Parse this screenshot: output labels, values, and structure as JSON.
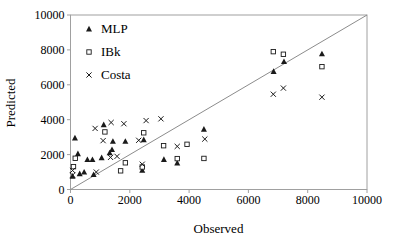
{
  "chart_data": {
    "type": "scatter",
    "title": "",
    "xlabel": "Observed",
    "ylabel": "Predicted",
    "xlim": [
      0,
      10000
    ],
    "ylim": [
      0,
      10000
    ],
    "x_ticks": [
      0,
      2000,
      4000,
      6000,
      8000,
      10000
    ],
    "y_ticks": [
      0,
      2000,
      4000,
      6000,
      8000,
      10000
    ],
    "grid": false,
    "legend_position": "top-left-inside",
    "reference_line": {
      "from": [
        0,
        0
      ],
      "to": [
        10000,
        10000
      ]
    },
    "series": [
      {
        "name": "MLP",
        "marker": "filled-triangle",
        "points": [
          [
            70,
            760
          ],
          [
            150,
            2950
          ],
          [
            250,
            2050
          ],
          [
            310,
            900
          ],
          [
            460,
            990
          ],
          [
            570,
            1710
          ],
          [
            740,
            1710
          ],
          [
            780,
            850
          ],
          [
            1050,
            1820
          ],
          [
            1120,
            3710
          ],
          [
            1320,
            2100
          ],
          [
            1400,
            2280
          ],
          [
            1430,
            2760
          ],
          [
            1850,
            2760
          ],
          [
            2420,
            1100
          ],
          [
            2470,
            2850
          ],
          [
            3150,
            1720
          ],
          [
            3600,
            1520
          ],
          [
            4500,
            3450
          ],
          [
            6850,
            6760
          ],
          [
            7200,
            7330
          ],
          [
            8480,
            7770
          ]
        ]
      },
      {
        "name": "IBk",
        "marker": "open-square",
        "points": [
          [
            100,
            1310
          ],
          [
            160,
            1790
          ],
          [
            1160,
            3300
          ],
          [
            1690,
            1070
          ],
          [
            1850,
            1530
          ],
          [
            2420,
            1290
          ],
          [
            2470,
            3250
          ],
          [
            3140,
            2510
          ],
          [
            3600,
            1770
          ],
          [
            3930,
            2590
          ],
          [
            4500,
            1780
          ],
          [
            6840,
            7900
          ],
          [
            7180,
            7750
          ],
          [
            8480,
            7040
          ]
        ]
      },
      {
        "name": "Costa",
        "marker": "x-cross",
        "points": [
          [
            70,
            820
          ],
          [
            70,
            1090
          ],
          [
            830,
            3500
          ],
          [
            870,
            1000
          ],
          [
            1100,
            2800
          ],
          [
            1350,
            1840
          ],
          [
            1370,
            3840
          ],
          [
            1570,
            1900
          ],
          [
            1800,
            3770
          ],
          [
            2300,
            2820
          ],
          [
            2420,
            1450
          ],
          [
            2550,
            3950
          ],
          [
            3050,
            4050
          ],
          [
            3600,
            2470
          ],
          [
            4530,
            2890
          ],
          [
            6840,
            5460
          ],
          [
            7180,
            5810
          ],
          [
            8480,
            5290
          ]
        ]
      }
    ],
    "colors": {
      "marker": "#1a1a1a",
      "axis": "#a0a0a0",
      "reference_line": "#8c8c8c",
      "text": "#000000",
      "background": "#ffffff"
    }
  }
}
